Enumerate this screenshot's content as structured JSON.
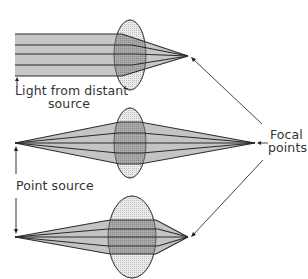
{
  "diagram": {
    "labels": {
      "distant_line1": "Light from distant",
      "distant_line2": "source",
      "point_source": "Point source",
      "focal_line1": "Focal",
      "focal_line2": "points"
    },
    "panels": [
      {
        "name": "parallel-light",
        "source": "distant",
        "lens": "thin convex",
        "focal_x": 188
      },
      {
        "name": "point-source-thin-lens",
        "source": "point",
        "lens": "thin convex",
        "focal_x": 255
      },
      {
        "name": "point-source-thick-lens",
        "source": "point",
        "lens": "thick convex",
        "focal_x": 188
      }
    ],
    "colors": {
      "beam_fill": "#c8c8c8",
      "lens_fill": "#e6e6e6",
      "overlap_fill": "#a8a8a8",
      "lines": "#333333"
    }
  }
}
